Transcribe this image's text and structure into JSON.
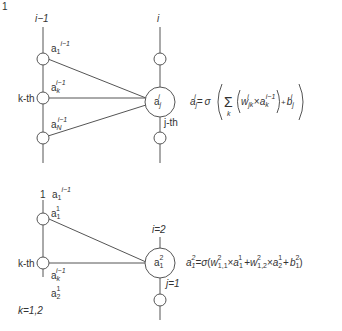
{
  "figure_label": "1",
  "top_panel": {
    "left_layer_label": "i−1",
    "right_layer_label": "i",
    "left_nodes": [
      {
        "name": "a",
        "sub": "1",
        "sup": "i−1"
      },
      {
        "name": "a",
        "sub": "k",
        "sup": "i−1",
        "side_label": "k-th"
      },
      {
        "name": "a",
        "sub": "N",
        "sup": "i−1"
      }
    ],
    "target_node": {
      "name": "a",
      "sub": "j",
      "sup": "i",
      "side_label": "j-th"
    },
    "equation": {
      "lhs": "a",
      "lhs_sub": "j",
      "lhs_sup": "i",
      "eq": "=",
      "sigma": "σ",
      "sum": "Σ",
      "sum_sub": "k",
      "w": "w",
      "w_sub": "jk",
      "w_sup": "i",
      "times": "×",
      "a": "a",
      "a_sub": "k",
      "a_sup": "i−1",
      "plus": "+",
      "b": "b",
      "b_sub": "j",
      "b_sup": "i"
    }
  },
  "bottom_panel": {
    "left_layer_label": "1",
    "right_layer_label": "i=2",
    "top_label": {
      "name": "a",
      "sub": "1",
      "sup": "i−1"
    },
    "left_nodes": [
      {
        "name": "a",
        "sub": "1",
        "sup": "1"
      },
      {
        "name": "a",
        "sub": "k",
        "sup": "i−1",
        "side_label": "k-th"
      }
    ],
    "extra_label": {
      "name": "a",
      "sub": "2",
      "sup": "1"
    },
    "k_range": "k=1,2",
    "target_node": {
      "name": "a",
      "sub": "1",
      "sup": "2",
      "side_label": "j=1"
    },
    "equation": {
      "lhs": "a",
      "lhs_sub": "1",
      "lhs_sup": "2",
      "eq": "=",
      "sigma": "σ",
      "open": "(",
      "w1": "w",
      "w1_sub": "1,1",
      "w1_sup": "2",
      "times": "×",
      "a1": "a",
      "a1_sub": "1",
      "a1_sup": "1",
      "plus": "+",
      "w2": "w",
      "w2_sub": "1,2",
      "w2_sup": "2",
      "a2": "a",
      "a2_sub": "2",
      "a2_sup": "1",
      "b": "b",
      "b_sub": "1",
      "b_sup": "2",
      "close": ")"
    }
  }
}
